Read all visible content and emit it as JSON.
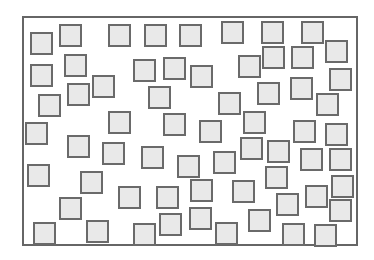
{
  "diagram": {
    "type": "scattered-squares",
    "frame": {
      "x": 22,
      "y": 16,
      "width": 334,
      "height": 228,
      "stroke": "#666666"
    },
    "square_fill": "#e9e9e9",
    "square_stroke": "#6a6a6a",
    "square_size": 23,
    "squares": [
      [
        30,
        32
      ],
      [
        59,
        24
      ],
      [
        108,
        24
      ],
      [
        144,
        24
      ],
      [
        179,
        24
      ],
      [
        221,
        21
      ],
      [
        261,
        21
      ],
      [
        301,
        21
      ],
      [
        30,
        64
      ],
      [
        64,
        54
      ],
      [
        133,
        59
      ],
      [
        163,
        57
      ],
      [
        190,
        65
      ],
      [
        238,
        55
      ],
      [
        262,
        46
      ],
      [
        291,
        46
      ],
      [
        325,
        40
      ],
      [
        38,
        94
      ],
      [
        67,
        83
      ],
      [
        92,
        75
      ],
      [
        148,
        86
      ],
      [
        218,
        92
      ],
      [
        257,
        82
      ],
      [
        290,
        77
      ],
      [
        329,
        68
      ],
      [
        316,
        93
      ],
      [
        25,
        122
      ],
      [
        108,
        111
      ],
      [
        163,
        113
      ],
      [
        199,
        120
      ],
      [
        243,
        111
      ],
      [
        293,
        120
      ],
      [
        325,
        123
      ],
      [
        67,
        135
      ],
      [
        102,
        142
      ],
      [
        141,
        146
      ],
      [
        177,
        155
      ],
      [
        213,
        151
      ],
      [
        240,
        137
      ],
      [
        267,
        140
      ],
      [
        300,
        148
      ],
      [
        329,
        148
      ],
      [
        27,
        164
      ],
      [
        80,
        171
      ],
      [
        118,
        186
      ],
      [
        156,
        186
      ],
      [
        190,
        179
      ],
      [
        232,
        180
      ],
      [
        265,
        166
      ],
      [
        305,
        185
      ],
      [
        331,
        175
      ],
      [
        59,
        197
      ],
      [
        159,
        213
      ],
      [
        189,
        207
      ],
      [
        248,
        209
      ],
      [
        276,
        193
      ],
      [
        329,
        199
      ],
      [
        33,
        222
      ],
      [
        86,
        220
      ],
      [
        133,
        223
      ],
      [
        215,
        222
      ],
      [
        282,
        223
      ],
      [
        314,
        224
      ]
    ]
  }
}
